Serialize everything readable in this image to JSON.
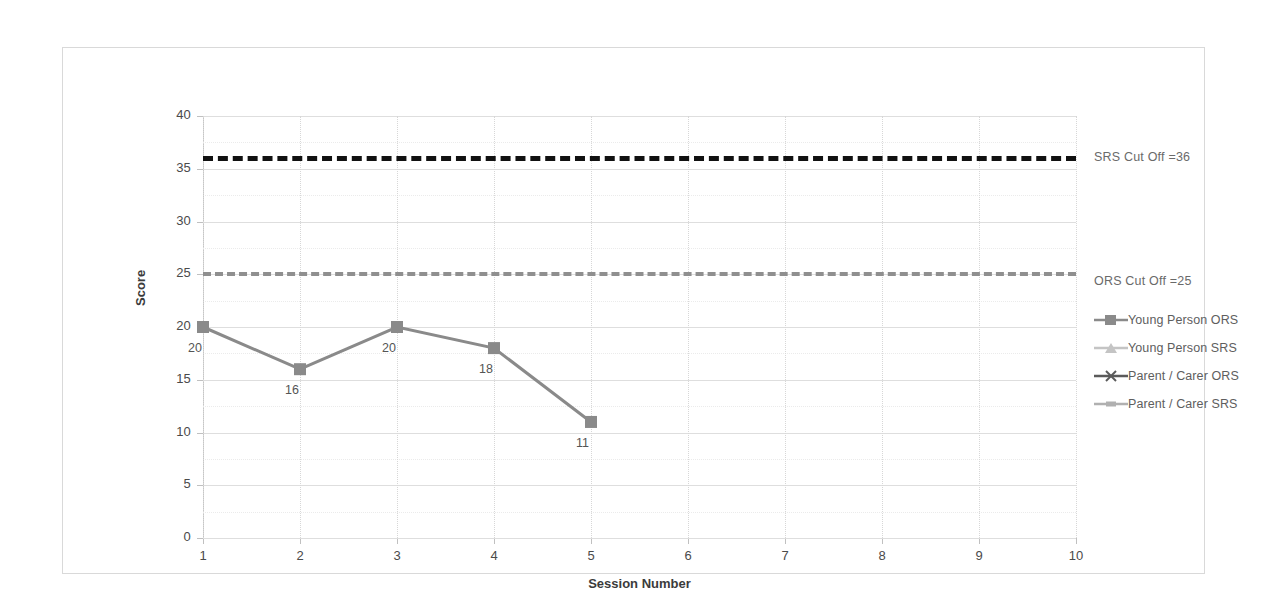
{
  "chart_data": {
    "type": "line",
    "title": "",
    "xlabel": "Session Number",
    "ylabel": "Score",
    "xlim": [
      1,
      10
    ],
    "ylim": [
      0,
      40
    ],
    "ytick_step": 5,
    "grid": true,
    "legend_position": "right",
    "x": [
      1,
      2,
      3,
      4,
      5,
      6,
      7,
      8,
      9,
      10
    ],
    "xticklabels": [
      "1",
      "2",
      "3",
      "4",
      "5",
      "6",
      "7",
      "8",
      "9",
      "10"
    ],
    "yticklabels": [
      "0",
      "5",
      "10",
      "15",
      "20",
      "25",
      "30",
      "35",
      "40"
    ],
    "yticks": [
      0,
      5,
      10,
      15,
      20,
      25,
      30,
      35,
      40
    ],
    "series": [
      {
        "name": "Young Person ORS",
        "color": "#8a8a8a",
        "marker": "square",
        "x": [
          1,
          2,
          3,
          4,
          5
        ],
        "values": [
          20,
          16,
          20,
          18,
          11
        ],
        "data_labels": [
          "20",
          "16",
          "20",
          "18",
          "11"
        ]
      },
      {
        "name": "Young Person SRS",
        "color": "#c4c4c4",
        "marker": "triangle",
        "x": [],
        "values": []
      },
      {
        "name": "Parent / Carer ORS",
        "color": "#5a5a5a",
        "marker": "cross",
        "x": [],
        "values": []
      },
      {
        "name": "Parent / Carer SRS",
        "color": "#b0b0b0",
        "marker": "dash",
        "x": [],
        "values": []
      }
    ],
    "reference_lines": [
      {
        "name": "SRS Cut Off",
        "label": "SRS Cut Off =36",
        "value": 36,
        "color": "#111111",
        "style": "dashed"
      },
      {
        "name": "ORS Cut Off",
        "label": "ORS Cut Off =25",
        "value": 25,
        "color": "#8f8f8f",
        "style": "long-dashed"
      }
    ]
  },
  "legend": {
    "items": [
      {
        "label": "Young Person ORS",
        "color": "#8a8a8a",
        "marker": "square"
      },
      {
        "label": "Young Person SRS",
        "color": "#c4c4c4",
        "marker": "triangle"
      },
      {
        "label": "Parent / Carer ORS",
        "color": "#5a5a5a",
        "marker": "cross"
      },
      {
        "label": "Parent / Carer SRS",
        "color": "#b0b0b0",
        "marker": "dash"
      }
    ]
  }
}
